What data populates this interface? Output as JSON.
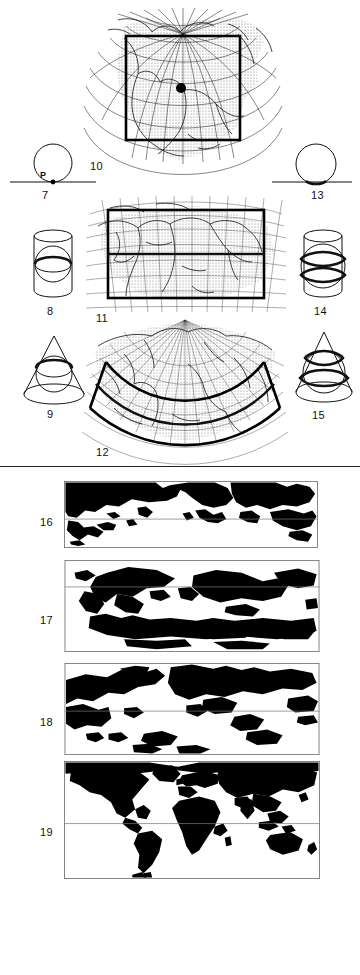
{
  "figure": {
    "kind": "cartography-plate",
    "background": "#ffffff",
    "ink": "#000000"
  },
  "left_column": [
    {
      "number": "7",
      "name": "tangent-plane-on-globe",
      "surface": "plane",
      "case": "tangent",
      "point_label": "P",
      "standard_lines": 1
    },
    {
      "number": "8",
      "name": "tangent-cylinder-on-globe",
      "surface": "cylinder",
      "case": "tangent",
      "standard_lines": 1
    },
    {
      "number": "9",
      "name": "tangent-cone-on-globe",
      "surface": "cone",
      "case": "tangent",
      "standard_lines": 1
    }
  ],
  "center_column": [
    {
      "number": "10",
      "name": "azimuthal-graticule-north-america",
      "projection_class": "azimuthal",
      "region": "North America",
      "has_center_dot": true,
      "frame": "square"
    },
    {
      "number": "11",
      "name": "cylindrical-graticule-asia",
      "projection_class": "cylindrical",
      "region": "Asia",
      "frame": "rectangle",
      "standard_line": "horizontal"
    },
    {
      "number": "12",
      "name": "conic-graticule-fan",
      "projection_class": "conic",
      "region": "North Asia / Pacific",
      "frame": "arc-band",
      "standard_line": "arc"
    }
  ],
  "right_column": [
    {
      "number": "13",
      "name": "secant-plane-on-globe",
      "surface": "plane",
      "case": "secant",
      "standard_lines": 1
    },
    {
      "number": "14",
      "name": "secant-cylinder-on-globe",
      "surface": "cylinder",
      "case": "secant",
      "standard_lines": 2
    },
    {
      "number": "15",
      "name": "secant-cone-on-globe",
      "surface": "cone",
      "case": "secant",
      "standard_lines": 2
    }
  ],
  "world_maps": [
    {
      "number": "16",
      "name": "world-map-compressed",
      "aspect": "wide-flat",
      "equator_line": true,
      "land_fill": "#000000"
    },
    {
      "number": "17",
      "name": "world-map-high-latitude-stretched",
      "aspect": "tall",
      "equator_line": true,
      "land_fill": "#000000"
    },
    {
      "number": "18",
      "name": "world-map-mid-stretched",
      "aspect": "tall",
      "equator_line": true,
      "land_fill": "#000000"
    },
    {
      "number": "19",
      "name": "world-map-equirectangular",
      "aspect": "standard",
      "equator_line": true,
      "land_fill": "#000000"
    }
  ],
  "labels": {
    "n7": "7",
    "n8": "8",
    "n9": "9",
    "n10": "10",
    "n11": "11",
    "n12": "12",
    "n13": "13",
    "n14": "14",
    "n15": "15",
    "n16": "16",
    "n17": "17",
    "n18": "18",
    "n19": "19",
    "point_p": "P"
  }
}
